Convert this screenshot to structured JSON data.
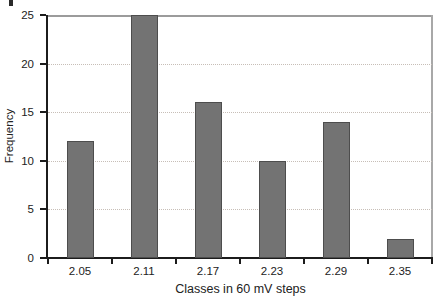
{
  "chart_data": {
    "type": "bar",
    "title": "",
    "categories": [
      "2.05",
      "2.11",
      "2.17",
      "2.23",
      "2.29",
      "2.35"
    ],
    "values": [
      12,
      25,
      16,
      10,
      14,
      2
    ],
    "xlabel": "Classes in 60 mV steps",
    "ylabel": "Frequency",
    "ylim": [
      0,
      25
    ],
    "yticks": [
      0,
      5,
      10,
      15,
      20,
      25
    ],
    "grid": "horizontal-dotted",
    "legend": "none",
    "colors": {
      "bar_fill": "#737373",
      "bar_border": "#4d4d4d",
      "axis": "#1c1c1c",
      "frame": "#a0a0a0",
      "gridline": "#c7beb7",
      "text": "#222222",
      "background": "#ffffff"
    }
  }
}
